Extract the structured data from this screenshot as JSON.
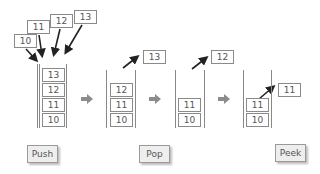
{
  "push_inputs": [
    "10",
    "11",
    "12",
    "13"
  ],
  "stacks": [
    {
      "name": "push-result",
      "items": [
        "13",
        "12",
        "11",
        "10"
      ]
    },
    {
      "name": "pop-1",
      "items": [
        "12",
        "11",
        "10"
      ],
      "popped": "13"
    },
    {
      "name": "pop-2",
      "items": [
        "11",
        "10"
      ],
      "popped": "12"
    },
    {
      "name": "peek",
      "items": [
        "11",
        "10"
      ],
      "peeked": "11"
    }
  ],
  "buttons": {
    "push": "Push",
    "pop": "Pop",
    "peek": "Peek"
  },
  "colors": {
    "arrow": "#222222",
    "flow_arrow": "#8c8c8c",
    "box_border": "#8a8a8a",
    "button_bg": "#eeeeee"
  }
}
